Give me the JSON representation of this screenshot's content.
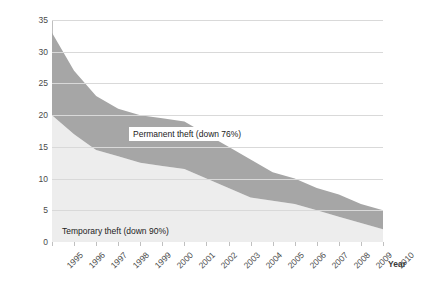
{
  "chart_data": {
    "type": "area",
    "title": "",
    "subtitle": "",
    "xlabel": "Year",
    "ylabel": "Rate per 1000 vehicle-owning households",
    "stacked": true,
    "grid": true,
    "legend_position": "inline-annotations",
    "xlim": [
      1995,
      2010
    ],
    "ylim": [
      0,
      35
    ],
    "ytick_step": 5,
    "categories": [
      "1995",
      "1996",
      "1997",
      "1998",
      "1999",
      "2000",
      "2001",
      "2002",
      "2003",
      "2004",
      "2005",
      "2006",
      "2007",
      "2008",
      "2009",
      "2010"
    ],
    "x": [
      1995,
      1996,
      1997,
      1998,
      1999,
      2000,
      2001,
      2002,
      2003,
      2004,
      2005,
      2006,
      2007,
      2008,
      2009,
      2010
    ],
    "ytick_labels": [
      "0",
      "5",
      "10",
      "15",
      "20",
      "25",
      "30",
      "35"
    ],
    "ytick_values": [
      0,
      5,
      10,
      15,
      20,
      25,
      30,
      35
    ],
    "series": [
      {
        "name": "Temporary theft",
        "annotation": "Temporary theft (down 90%)",
        "color": "#ededed",
        "values": [
          20.0,
          17.0,
          14.5,
          13.5,
          12.5,
          12.0,
          11.5,
          10.0,
          8.5,
          7.0,
          6.5,
          6.0,
          5.0,
          4.0,
          3.0,
          2.0
        ]
      },
      {
        "name": "Permanent theft",
        "annotation": "Permanent theft (down 76%)",
        "color": "#a6a6a6",
        "values": [
          13.0,
          10.0,
          8.5,
          7.5,
          7.5,
          7.5,
          7.5,
          7.0,
          6.5,
          6.0,
          4.5,
          4.0,
          3.5,
          3.5,
          3.0,
          3.0
        ]
      }
    ],
    "totals": [
      33.0,
      27.0,
      23.0,
      21.0,
      20.0,
      19.5,
      19.0,
      17.0,
      15.0,
      13.0,
      11.0,
      10.0,
      8.5,
      7.5,
      6.0,
      5.0
    ],
    "annotations": [
      {
        "id": "permanent",
        "text": "Permanent theft (down 76%)"
      },
      {
        "id": "temporary",
        "text": "Temporary theft (down 90%)"
      }
    ],
    "colors": {
      "permanent_band": "#a6a6a6",
      "temporary_band": "#ededed",
      "gridline": "#d9d9d9",
      "axis": "#bfbfbf",
      "text": "#4a4a4a",
      "background": "#ffffff"
    }
  }
}
